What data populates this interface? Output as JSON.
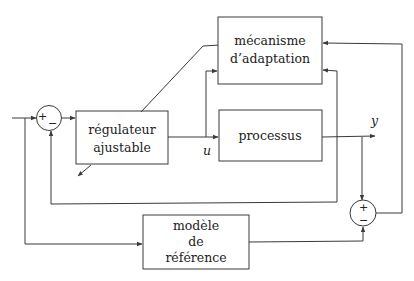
{
  "diagram": {
    "type": "block-diagram",
    "blocks": {
      "adaptation": {
        "line1": "mécanisme",
        "line2": "d’adaptation"
      },
      "regulator": {
        "line1": "régulateur",
        "line2": "ajustable"
      },
      "process": {
        "label": "processus"
      },
      "reference": {
        "line1": "modèle",
        "line2": "de",
        "line3": "référence"
      }
    },
    "signals": {
      "control": "u",
      "output": "y"
    },
    "summers": {
      "input_sum": {
        "plus": "+",
        "minus": "−"
      },
      "error_sum": {
        "plus": "+",
        "minus": "−"
      }
    }
  }
}
